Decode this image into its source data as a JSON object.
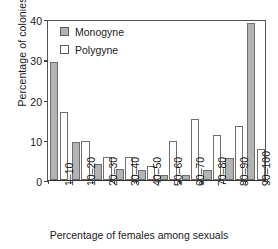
{
  "chart_data": {
    "type": "bar",
    "title": "",
    "xlabel": "Percentage of females among sexuals",
    "ylabel": "Percentage of colonies",
    "categories": [
      "1–10",
      "10–20",
      "20–30",
      "30–40",
      "40–50",
      "50–60",
      "60–70",
      "70–80",
      "80–90",
      "90–100"
    ],
    "series": [
      {
        "name": "Monogyne",
        "color": "#b3b3b3",
        "values": [
          29.3,
          9.5,
          4.0,
          2.8,
          2.4,
          1.3,
          1.3,
          2.6,
          5.5,
          39.0
        ]
      },
      {
        "name": "Polygyne",
        "color": "#ffffff",
        "values": [
          17.0,
          9.7,
          5.6,
          5.6,
          3.6,
          9.7,
          15.2,
          11.3,
          13.4,
          7.6
        ]
      }
    ],
    "ylim": [
      0,
      40
    ],
    "yticks": [
      0,
      10,
      20,
      30,
      40
    ],
    "grid": false,
    "legend_position": "top-left"
  },
  "legend": {
    "entries": [
      {
        "label": "Monogyne",
        "swatch": "filled-gray-square"
      },
      {
        "label": "Polygyne",
        "swatch": "open-white-square"
      }
    ]
  }
}
